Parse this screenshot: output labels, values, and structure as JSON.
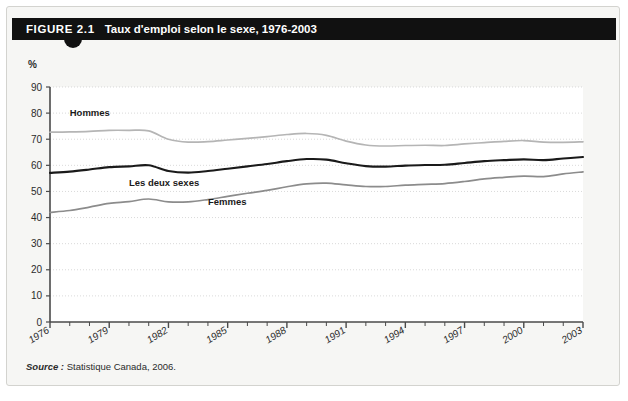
{
  "figure": {
    "number": "FIGURE 2.1",
    "title": "Taux d'emploi selon le sexe, 1976-2003",
    "unit_label": "%",
    "source_lead": "Source :",
    "source_text": "Statistique Canada, 2006."
  },
  "chart_data": {
    "type": "line",
    "title": "Taux d'emploi selon le sexe, 1976-2003",
    "xlabel": "",
    "ylabel": "%",
    "ylim": [
      0,
      90
    ],
    "ytick_values": [
      0,
      10,
      20,
      30,
      40,
      50,
      60,
      70,
      80,
      90
    ],
    "ytick_labels": [
      "0",
      "10",
      "20",
      "30",
      "40",
      "50",
      "60",
      "70",
      "80",
      "90"
    ],
    "xlim": [
      1976,
      2003
    ],
    "x": [
      1976,
      1977,
      1978,
      1979,
      1980,
      1981,
      1982,
      1983,
      1984,
      1985,
      1986,
      1987,
      1988,
      1989,
      1990,
      1991,
      1992,
      1993,
      1994,
      1995,
      1996,
      1997,
      1998,
      1999,
      2000,
      2001,
      2002,
      2003
    ],
    "xtick_labels": [
      "1976",
      "1979",
      "1982",
      "1985",
      "1988",
      "1991",
      "1994",
      "1997",
      "2000",
      "2003"
    ],
    "xtick_values": [
      1976,
      1979,
      1982,
      1985,
      1988,
      1991,
      1994,
      1997,
      2000,
      2003
    ],
    "grid": true,
    "grid_axis": "y",
    "legend_position": "inline-labels",
    "series": [
      {
        "name": "Hommes",
        "color": "#b5b5b5",
        "label_x": 1977,
        "label_y": 79,
        "values": [
          72.7,
          72.8,
          73.0,
          73.4,
          73.4,
          73.2,
          70.0,
          68.9,
          69.1,
          69.7,
          70.3,
          71.0,
          71.8,
          72.2,
          71.5,
          69.3,
          67.8,
          67.4,
          67.6,
          67.7,
          67.6,
          68.2,
          68.7,
          69.2,
          69.5,
          68.9,
          68.8,
          69.0
        ]
      },
      {
        "name": "Les deux sexes",
        "color": "#1a1a1a",
        "label_x": 1980,
        "label_y": 52,
        "values": [
          57.1,
          57.6,
          58.4,
          59.3,
          59.6,
          60.0,
          57.8,
          57.2,
          57.8,
          58.7,
          59.6,
          60.5,
          61.6,
          62.4,
          62.2,
          60.8,
          59.7,
          59.5,
          59.9,
          60.1,
          60.2,
          60.9,
          61.6,
          62.0,
          62.3,
          62.0,
          62.6,
          63.2
        ]
      },
      {
        "name": "Femmes",
        "color": "#8c8c8c",
        "label_x": 1984,
        "label_y": 45,
        "values": [
          42.0,
          42.7,
          44.0,
          45.4,
          46.1,
          47.1,
          46.0,
          46.0,
          46.9,
          48.1,
          49.3,
          50.4,
          51.8,
          52.9,
          53.2,
          52.5,
          51.9,
          51.9,
          52.4,
          52.7,
          53.0,
          53.8,
          54.8,
          55.4,
          55.9,
          55.7,
          56.7,
          57.5
        ]
      }
    ]
  }
}
